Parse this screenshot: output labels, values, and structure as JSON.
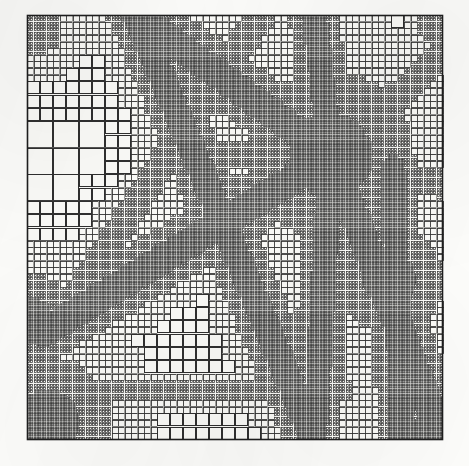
{
  "figure": {
    "kind": "adaptive-mesh-refinement-quadtree",
    "caption": "",
    "title": ""
  },
  "canvas": {
    "width": 469,
    "height": 466,
    "background_color": "#fdfdfb"
  },
  "mesh": {
    "domain_px": {
      "x": 27,
      "y": 15,
      "width": 416,
      "height": 425
    },
    "line_color": "#2f2f2f",
    "line_width": 1.0,
    "outer_border_color": "#1e1e1e",
    "outer_border_width": 1.6,
    "cell_fill_color": "#fbfbf8",
    "min_level": 3,
    "max_level": 8,
    "base_level": 3,
    "seed": 20240917
  },
  "chart_data": {
    "type": "heatmap",
    "xlabel": "x",
    "ylabel": "y",
    "xlim": [
      0,
      1
    ],
    "ylim": [
      0,
      1
    ],
    "grid": true,
    "legend": "none",
    "refinement_levels": [
      3,
      4,
      5,
      6,
      7,
      8
    ],
    "features": [
      {
        "name": "ray-hub-to-upper-left",
        "type": "segment",
        "x1": 0.73,
        "y1": 0.33,
        "x2": 0.262,
        "y2": 0.0,
        "halfwidth": 0.03,
        "level": 8
      },
      {
        "name": "ray-hub-to-top",
        "type": "segment",
        "x1": 0.73,
        "y1": 0.33,
        "x2": 0.69,
        "y2": 0.0,
        "halfwidth": 0.026,
        "level": 8
      },
      {
        "name": "ray-hub-to-upper-right",
        "type": "segment",
        "x1": 0.73,
        "y1": 0.33,
        "x2": 0.985,
        "y2": 0.105,
        "halfwidth": 0.024,
        "level": 7
      },
      {
        "name": "ray-hub-to-right-edge",
        "type": "segment",
        "x1": 0.73,
        "y1": 0.33,
        "x2": 1.0,
        "y2": 0.4,
        "halfwidth": 0.022,
        "level": 7
      },
      {
        "name": "ray-hub-to-lower-right",
        "type": "segment",
        "x1": 0.73,
        "y1": 0.33,
        "x2": 1.0,
        "y2": 1.0,
        "halfwidth": 0.03,
        "level": 8
      },
      {
        "name": "ray-hub-to-bottom",
        "type": "segment",
        "x1": 0.73,
        "y1": 0.33,
        "x2": 0.69,
        "y2": 1.0,
        "halfwidth": 0.026,
        "level": 8
      },
      {
        "name": "ray-hub-to-lower-left",
        "type": "segment",
        "x1": 0.73,
        "y1": 0.33,
        "x2": 0.04,
        "y2": 0.745,
        "halfwidth": 0.03,
        "level": 8
      },
      {
        "name": "ray-hub-to-left",
        "type": "segment",
        "x1": 0.73,
        "y1": 0.33,
        "x2": 0.33,
        "y2": 0.33,
        "halfwidth": 0.02,
        "level": 7
      },
      {
        "name": "main-diagonal-nw-to-se",
        "type": "segment",
        "x1": 0.262,
        "y1": 0.0,
        "x2": 0.69,
        "y2": 1.0,
        "halfwidth": 0.028,
        "level": 8
      },
      {
        "name": "diagonal-upper-left-branch",
        "type": "segment",
        "x1": 0.56,
        "y1": 0.0,
        "x2": 0.09,
        "y2": 0.7,
        "halfwidth": 0.024,
        "level": 7
      },
      {
        "name": "lower-horizontal-band",
        "type": "segment",
        "x1": 0.12,
        "y1": 0.885,
        "x2": 0.76,
        "y2": 0.885,
        "halfwidth": 0.02,
        "level": 7
      },
      {
        "name": "right-vertical-band",
        "type": "segment",
        "x1": 0.88,
        "y1": 0.36,
        "x2": 0.9,
        "y2": 1.0,
        "halfwidth": 0.026,
        "level": 8
      },
      {
        "name": "corner-blob-bottom-left",
        "type": "disc",
        "cx": 0.045,
        "cy": 0.96,
        "r": 0.075,
        "level": 8
      },
      {
        "name": "corner-blob-top-left",
        "type": "disc",
        "cx": 0.02,
        "cy": 0.03,
        "r": 0.055,
        "level": 7
      },
      {
        "name": "corner-blob-top-right",
        "type": "disc",
        "cx": 0.985,
        "cy": 0.03,
        "r": 0.035,
        "level": 7
      },
      {
        "name": "corner-blob-bottom-right",
        "type": "disc",
        "cx": 0.985,
        "cy": 0.985,
        "r": 0.055,
        "level": 8
      },
      {
        "name": "hub-core",
        "type": "disc",
        "cx": 0.73,
        "cy": 0.33,
        "r": 0.095,
        "level": 8
      },
      {
        "name": "secondary-hub",
        "type": "disc",
        "cx": 0.87,
        "cy": 0.62,
        "r": 0.06,
        "level": 8
      },
      {
        "name": "left-edge-notch",
        "type": "disc",
        "cx": 0.01,
        "cy": 0.72,
        "r": 0.05,
        "level": 8
      }
    ]
  }
}
